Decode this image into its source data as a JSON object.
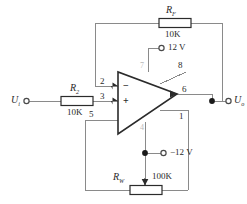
{
  "diagram": {
    "type": "schematic",
    "colors": {
      "wire": "#8a8a8a",
      "device_outline": "#2b2b2b",
      "text": "#2a2a2a",
      "faint_text": "#b9b9b9",
      "background": "#ffffff"
    }
  },
  "components": {
    "feedback_resistor": {
      "name": "R",
      "subscript": "F",
      "value": "10K",
      "role": "feedback-resistor"
    },
    "input_resistor": {
      "name": "R",
      "subscript": "2",
      "value": "10K",
      "role": "input-series-resistor"
    },
    "null_potentiometer": {
      "name": "R",
      "subscript": "W",
      "value": "100K",
      "role": "offset-null-potentiometer"
    },
    "opamp": {
      "inverting_sign": "−",
      "noninverting_sign": "+",
      "supply_pin_positive": "7",
      "supply_pin_negative": "4"
    }
  },
  "pins": {
    "inverting_input": "2",
    "noninverting_input": "3",
    "offset_null_a": "5",
    "offset_null_b": "1",
    "compensation": "8",
    "output": "6"
  },
  "supplies": {
    "positive": "12 V",
    "negative": "−12 V"
  },
  "ports": {
    "input": {
      "name": "U",
      "subscript": "i"
    },
    "output": {
      "name": "U",
      "subscript": "o"
    }
  }
}
